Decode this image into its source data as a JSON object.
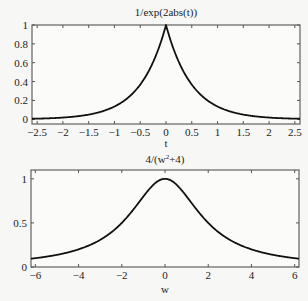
{
  "chart_data": [
    {
      "type": "line",
      "title": "1/exp(2abs(t))",
      "xlabel": "t",
      "ylabel": "",
      "xlim": [
        -2.6,
        2.6
      ],
      "ylim": [
        -0.05,
        1.0
      ],
      "xticks": [
        -2.5,
        -2,
        -1.5,
        -1,
        -0.5,
        0,
        0.5,
        1,
        1.5,
        2,
        2.5
      ],
      "xtick_labels": [
        "-2.5",
        "-2",
        "-1.5",
        "-1",
        "-0.5",
        "0",
        "0.5",
        "1",
        "1.5",
        "2",
        "2.5"
      ],
      "yticks": [
        0,
        0.2,
        0.4,
        0.6,
        0.8,
        1
      ],
      "ytick_labels": [
        "0",
        "0.2",
        "0.4",
        "0.6",
        "0.8",
        "1"
      ],
      "grid": false,
      "legend": null,
      "series": [
        {
          "name": "exp(-2|t|)",
          "x": [
            -2.6,
            -2.5,
            -2.0,
            -1.5,
            -1.0,
            -0.75,
            -0.5,
            -0.25,
            0,
            0.25,
            0.5,
            0.75,
            1.0,
            1.5,
            2.0,
            2.5,
            2.6
          ],
          "y": [
            0.006,
            0.007,
            0.018,
            0.05,
            0.135,
            0.223,
            0.368,
            0.607,
            1.0,
            0.607,
            0.368,
            0.223,
            0.135,
            0.05,
            0.018,
            0.007,
            0.006
          ]
        }
      ]
    },
    {
      "type": "line",
      "title": "4/(w²+4)",
      "title_parts": {
        "pre": "4/(w",
        "sup": "2",
        "post": "+4)"
      },
      "xlabel": "w",
      "ylabel": "",
      "xlim": [
        -6.2,
        6.2
      ],
      "ylim": [
        0,
        1.1
      ],
      "xticks": [
        -6,
        -4,
        -2,
        0,
        2,
        4,
        6
      ],
      "xtick_labels": [
        "-6",
        "-4",
        "-2",
        "0",
        "2",
        "4",
        "6"
      ],
      "yticks": [
        0,
        0.5,
        1
      ],
      "ytick_labels": [
        "0",
        "0.5",
        "1"
      ],
      "grid": false,
      "legend": null,
      "series": [
        {
          "name": "4/(w^2+4)",
          "x": [
            -6.2,
            -6,
            -5,
            -4,
            -3,
            -2,
            -1.5,
            -1,
            -0.5,
            0,
            0.5,
            1,
            1.5,
            2,
            3,
            4,
            5,
            6,
            6.2
          ],
          "y": [
            0.094,
            0.1,
            0.138,
            0.2,
            0.308,
            0.5,
            0.64,
            0.8,
            0.941,
            1.0,
            0.941,
            0.8,
            0.64,
            0.5,
            0.308,
            0.2,
            0.138,
            0.1,
            0.094
          ]
        }
      ]
    }
  ],
  "colors": {
    "background": "#f7f7f5",
    "axes": "#555555",
    "line": "#111111",
    "text": "#222222"
  },
  "layout": {
    "plots": [
      {
        "left": 32,
        "top": 25,
        "right": 300,
        "bottom": 124,
        "title_y": 16,
        "xlabel_y": 147
      },
      {
        "left": 31,
        "top": 170,
        "right": 299,
        "bottom": 267,
        "title_y": 163,
        "xlabel_y": 293
      }
    ]
  }
}
